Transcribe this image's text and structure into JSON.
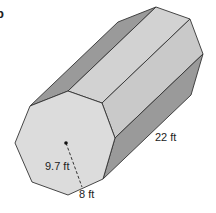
{
  "figure": {
    "type": "octagonal prism",
    "part_label": "b",
    "labels": {
      "length": "22 ft",
      "apothem": "9.7 ft",
      "side": "8 ft"
    },
    "colors": {
      "front_face": "#dcdcdc",
      "top_face": "#d2d2d2",
      "upper_side_face": "#c9c9c9",
      "dark_side_face": "#9a9a9a",
      "edge": "#333333"
    }
  }
}
